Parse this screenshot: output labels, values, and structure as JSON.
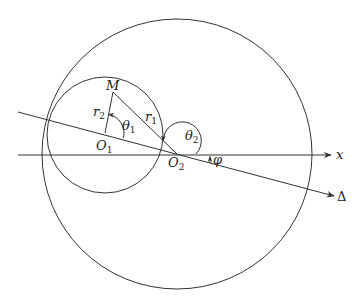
{
  "diagram": {
    "type": "geometry",
    "colors": {
      "stroke": "#333333",
      "text": "#222222",
      "background": "#ffffff"
    },
    "circles": [
      {
        "name": "small-circle",
        "center_label": "O_1",
        "cx": 105,
        "cy": 134,
        "r": 57
      },
      {
        "name": "large-circle",
        "center_label": "O_2",
        "cx": 177,
        "cy": 154,
        "r": 135
      }
    ],
    "points": {
      "M": {
        "x": 113,
        "y": 92
      },
      "O1": {
        "x": 105,
        "y": 133
      },
      "O2": {
        "x": 177,
        "y": 154
      }
    },
    "lines": {
      "x_axis": {
        "from": [
          18,
          155
        ],
        "to": [
          332,
          155
        ],
        "arrow": true
      },
      "delta": {
        "from": [
          18,
          112
        ],
        "to": [
          335,
          196
        ],
        "arrow": true
      }
    },
    "labels": {
      "M": "M",
      "O1_main": "O",
      "O1_sub": "1",
      "O2_main": "O",
      "O2_sub": "2",
      "r1_main": "r",
      "r1_sub": "1",
      "r2_main": "r",
      "r2_sub": "2",
      "theta1_main": "θ",
      "theta1_sub": "1",
      "theta2_main": "θ",
      "theta2_sub": "2",
      "phi": "φ",
      "x": "x",
      "delta": "Δ"
    }
  }
}
